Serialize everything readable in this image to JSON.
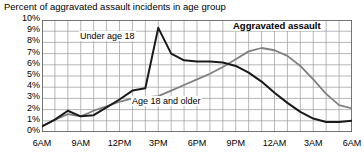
{
  "chart_data": {
    "type": "line",
    "title": "Percent of aggravated assault incidents in age group",
    "xlabel": "",
    "ylabel": "",
    "ylim": [
      0,
      10
    ],
    "yticks": [
      "0%",
      "1%",
      "2%",
      "3%",
      "4%",
      "5%",
      "6%",
      "7%",
      "8%",
      "9%",
      "10%"
    ],
    "xticks": [
      "6AM",
      "9AM",
      "12PM",
      "3PM",
      "6PM",
      "9PM",
      "12AM",
      "3AM",
      "6AM"
    ],
    "xtick_hours": [
      0,
      3,
      6,
      9,
      12,
      15,
      18,
      21,
      24
    ],
    "grid": true,
    "legend_position": "inline-annotations",
    "annotations": [
      {
        "text": "Aggravated assault",
        "bold": true
      },
      {
        "text": "Under age 18",
        "bold": false
      },
      {
        "text": "Age 18 and older",
        "bold": false
      }
    ],
    "x": [
      0,
      1,
      2,
      3,
      4,
      5,
      6,
      7,
      8,
      9,
      10,
      11,
      12,
      13,
      14,
      15,
      16,
      17,
      18,
      19,
      20,
      21,
      22,
      23,
      24
    ],
    "x_hour_labels": [
      "6AM",
      "7AM",
      "8AM",
      "9AM",
      "10AM",
      "11AM",
      "12PM",
      "1PM",
      "2PM",
      "3PM",
      "4PM",
      "5PM",
      "6PM",
      "7PM",
      "8PM",
      "9PM",
      "10PM",
      "11PM",
      "12AM",
      "1AM",
      "2AM",
      "3AM",
      "4AM",
      "5AM",
      "6AM"
    ],
    "series": [
      {
        "name": "Under age 18",
        "color": "#1a1a1a",
        "values": [
          0.5,
          1.1,
          1.9,
          1.4,
          1.5,
          2.2,
          2.9,
          3.7,
          3.9,
          9.3,
          7.0,
          6.4,
          6.3,
          6.3,
          6.2,
          5.9,
          5.3,
          4.5,
          3.5,
          2.6,
          1.8,
          1.2,
          0.9,
          0.9,
          1.0
        ]
      },
      {
        "name": "Age 18 and older",
        "color": "#808080",
        "values": [
          0.5,
          1.1,
          1.6,
          1.4,
          1.9,
          2.3,
          2.7,
          3.0,
          3.1,
          3.2,
          3.7,
          4.2,
          4.7,
          5.2,
          5.8,
          6.5,
          7.2,
          7.5,
          7.3,
          6.8,
          5.9,
          4.7,
          3.4,
          2.4,
          2.1
        ]
      }
    ]
  },
  "labels": {
    "annotation_under18": "Under age 18",
    "annotation_older": "Age 18 and older",
    "annotation_aggravated": "Aggravated assault"
  }
}
